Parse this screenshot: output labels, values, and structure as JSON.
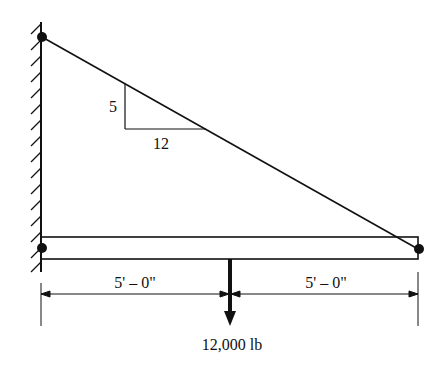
{
  "diagram": {
    "type": "cantilever-beam-with-tie-rod",
    "slope": {
      "rise_label": "5",
      "run_label": "12"
    },
    "dimensions": [
      {
        "label": "5' – 0\""
      },
      {
        "label": "5' – 0\""
      }
    ],
    "load": {
      "label": "12,000 lb",
      "direction": "down"
    },
    "supports": {
      "wall": "fixed-wall-hatched",
      "pins": [
        "top-wall-pin",
        "beam-wall-pin",
        "beam-end-pin"
      ]
    },
    "colors": {
      "ink": "#111111",
      "background": "#ffffff"
    }
  }
}
